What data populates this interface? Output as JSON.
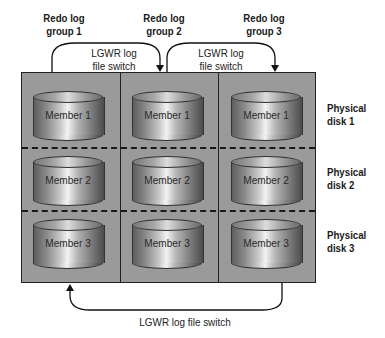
{
  "diagram": {
    "groups": [
      {
        "label_line1": "Redo log",
        "label_line2": "group 1"
      },
      {
        "label_line1": "Redo log",
        "label_line2": "group 2"
      },
      {
        "label_line1": "Redo log",
        "label_line2": "group 3"
      }
    ],
    "disks": [
      {
        "label_line1": "Physical",
        "label_line2": "disk 1"
      },
      {
        "label_line1": "Physical",
        "label_line2": "disk 2"
      },
      {
        "label_line1": "Physical",
        "label_line2": "disk 3"
      }
    ],
    "members": [
      [
        "Member 1",
        "Member 1",
        "Member 1"
      ],
      [
        "Member 2",
        "Member 2",
        "Member 2"
      ],
      [
        "Member 3",
        "Member 3",
        "Member 3"
      ]
    ],
    "switches": {
      "top_1_to_2": {
        "line1": "LGWR log",
        "line2": "file switch"
      },
      "top_2_to_3": {
        "line1": "LGWR log",
        "line2": "file switch"
      },
      "bottom_3_to_1": "LGWR log file switch"
    },
    "colors": {
      "grid_fill": "#9a9a9a",
      "border": "#222222",
      "background": "#ffffff"
    }
  }
}
